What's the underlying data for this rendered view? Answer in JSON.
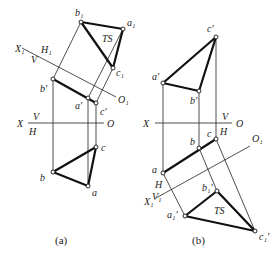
{
  "figures": [
    {
      "id": "a",
      "caption": "(a)",
      "axis_main": {
        "x": "X",
        "o": "O",
        "above": "V",
        "below": "H"
      },
      "axis_aux": {
        "x": "X₁",
        "o": "O₁",
        "above": "H₁",
        "below": "V"
      },
      "true_shape_label": "TS",
      "points": {
        "b1": "b₁",
        "a1": "a₁",
        "c1": "c₁",
        "bp": "b′",
        "ap": "a′",
        "cp": "c′",
        "b": "b",
        "a": "a",
        "c": "c"
      }
    },
    {
      "id": "b",
      "caption": "(b)",
      "axis_main": {
        "x": "X",
        "o": "O",
        "above": "V",
        "below": "H"
      },
      "axis_aux": {
        "x": "X₁",
        "o": "O₁",
        "above": "H",
        "below": "V₁"
      },
      "true_shape_label": "TS",
      "points": {
        "cp": "c′",
        "ap": "a′",
        "bp": "b′",
        "a": "a",
        "b": "b",
        "c": "c",
        "a1p": "a₁′",
        "b1p": "b₁′",
        "c1p": "c₁′"
      }
    }
  ]
}
